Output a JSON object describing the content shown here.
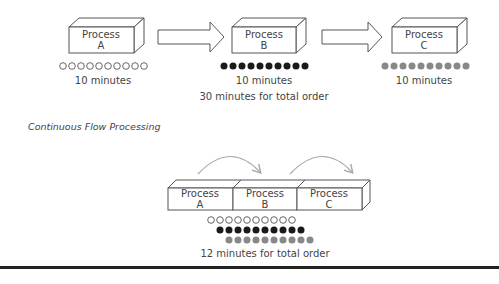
{
  "batch": {
    "processes": [
      {
        "name": "Process",
        "letter": "A",
        "time": "10 minutes",
        "dot_style": "hollow"
      },
      {
        "name": "Process",
        "letter": "B",
        "time": "10 minutes",
        "dot_style": "black"
      },
      {
        "name": "Process",
        "letter": "C",
        "time": "10 minutes",
        "dot_style": "gray"
      }
    ],
    "total": "30 minutes for total order",
    "dots_per_process": 10
  },
  "section_label": "Continuous Flow Processing",
  "flow": {
    "processes": [
      {
        "name": "Process",
        "letter": "A"
      },
      {
        "name": "Process",
        "letter": "B"
      },
      {
        "name": "Process",
        "letter": "C"
      }
    ],
    "total": "12 minutes for total order"
  },
  "colors": {
    "outline": "#555555",
    "black_dot": "#1a1a1a",
    "gray_dot": "#888888",
    "curve": "#aaaaaa",
    "rule": "#222222"
  }
}
